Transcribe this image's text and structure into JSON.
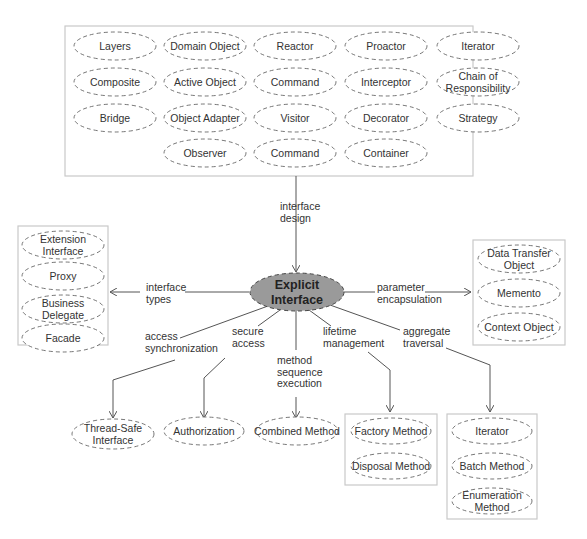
{
  "diagram": {
    "center": {
      "label_line1": "Explicit",
      "label_line2": "Interface",
      "fill": "#9a9a9a"
    },
    "top_group": {
      "nodes": [
        {
          "lines": [
            "Layers"
          ]
        },
        {
          "lines": [
            "Domain Object"
          ]
        },
        {
          "lines": [
            "Reactor"
          ]
        },
        {
          "lines": [
            "Proactor"
          ]
        },
        {
          "lines": [
            "Iterator"
          ]
        },
        {
          "lines": [
            "Composite"
          ]
        },
        {
          "lines": [
            "Active Object"
          ]
        },
        {
          "lines": [
            "Command"
          ]
        },
        {
          "lines": [
            "Interceptor"
          ]
        },
        {
          "lines": [
            "Chain of",
            "Responsibility"
          ]
        },
        {
          "lines": [
            "Bridge"
          ]
        },
        {
          "lines": [
            "Object Adapter"
          ]
        },
        {
          "lines": [
            "Visitor"
          ]
        },
        {
          "lines": [
            "Decorator"
          ]
        },
        {
          "lines": [
            "Strategy"
          ]
        },
        {
          "lines": [
            "Observer"
          ]
        },
        {
          "lines": [
            "Command"
          ]
        },
        {
          "lines": [
            "Container"
          ]
        }
      ]
    },
    "left_group": {
      "nodes": [
        {
          "lines": [
            "Extension",
            "Interface"
          ]
        },
        {
          "lines": [
            "Proxy"
          ]
        },
        {
          "lines": [
            "Business",
            "Delegate"
          ]
        },
        {
          "lines": [
            "Facade"
          ]
        }
      ]
    },
    "right_group": {
      "nodes": [
        {
          "lines": [
            "Data Transfer",
            "Object"
          ]
        },
        {
          "lines": [
            "Memento"
          ]
        },
        {
          "lines": [
            "Context Object"
          ]
        }
      ]
    },
    "lifetime_group": {
      "nodes": [
        {
          "lines": [
            "Factory Method"
          ]
        },
        {
          "lines": [
            "Disposal Method"
          ]
        }
      ]
    },
    "traversal_group": {
      "nodes": [
        {
          "lines": [
            "Iterator"
          ]
        },
        {
          "lines": [
            "Batch Method"
          ]
        },
        {
          "lines": [
            "Enumeration",
            "Method"
          ]
        }
      ]
    },
    "standalone_nodes": {
      "thread_safe": {
        "lines": [
          "Thread-Safe",
          "Interface"
        ]
      },
      "authorization": {
        "lines": [
          "Authorization"
        ]
      },
      "combined_method": {
        "lines": [
          "Combined Method"
        ]
      }
    },
    "edge_labels": {
      "interface_design": [
        "interface",
        "design"
      ],
      "interface_types": [
        "interface",
        "types"
      ],
      "parameter_encapsulation": [
        "parameter",
        "encapsulation"
      ],
      "access_synchronization": [
        "access",
        "synchronization"
      ],
      "secure_access": [
        "secure",
        "access"
      ],
      "method_sequence_execution": [
        "method",
        "sequence",
        "execution"
      ],
      "lifetime_management": [
        "lifetime",
        "management"
      ],
      "aggregate_traversal": [
        "aggregate",
        "traversal"
      ]
    }
  }
}
